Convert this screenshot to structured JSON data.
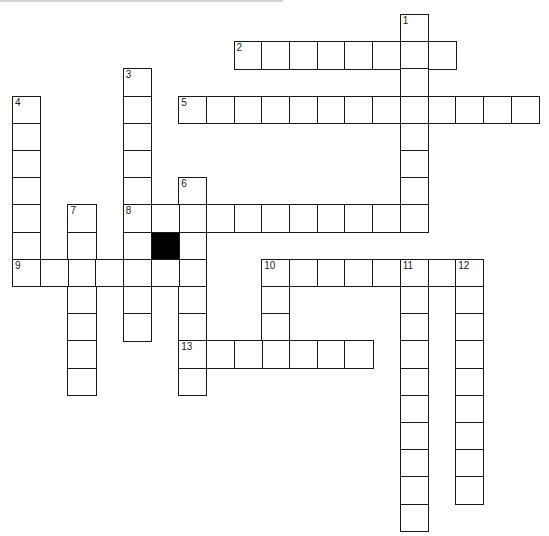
{
  "puzzle": {
    "type": "crossword",
    "grid_origin": {
      "x": 12,
      "y": 14
    },
    "cell_size": {
      "w": 27.7,
      "h": 27.2
    },
    "colors": {
      "border": "#1a1a1a",
      "fill": "#ffffff",
      "block": "#000000",
      "top_rule": "#d4d4d4"
    },
    "clue_numbers": [
      "1",
      "2",
      "3",
      "4",
      "5",
      "6",
      "7",
      "8",
      "9",
      "10",
      "11",
      "12",
      "13"
    ],
    "entries": [
      {
        "number": "1",
        "direction": "down",
        "row": 0,
        "col": 14,
        "length": 8
      },
      {
        "number": "2",
        "direction": "across",
        "row": 1,
        "col": 8,
        "length": 8
      },
      {
        "number": "3",
        "direction": "down",
        "row": 2,
        "col": 4,
        "length": 10
      },
      {
        "number": "4",
        "direction": "down",
        "row": 3,
        "col": 0,
        "length": 7
      },
      {
        "number": "5",
        "direction": "across",
        "row": 3,
        "col": 6,
        "length": 13
      },
      {
        "number": "6",
        "direction": "down",
        "row": 6,
        "col": 6,
        "length": 8
      },
      {
        "number": "7",
        "direction": "down",
        "row": 7,
        "col": 2,
        "length": 7
      },
      {
        "number": "8",
        "direction": "across",
        "row": 7,
        "col": 4,
        "length": 11
      },
      {
        "number": "9",
        "direction": "across",
        "row": 9,
        "col": 0,
        "length": 7
      },
      {
        "number": "10",
        "direction": "across",
        "row": 9,
        "col": 9,
        "length": 8
      },
      {
        "number": "10",
        "direction": "down",
        "row": 9,
        "col": 9,
        "length": 4
      },
      {
        "number": "11",
        "direction": "down",
        "row": 9,
        "col": 14,
        "length": 10
      },
      {
        "number": "12",
        "direction": "down",
        "row": 9,
        "col": 16,
        "length": 9
      },
      {
        "number": "13",
        "direction": "across",
        "row": 12,
        "col": 6,
        "length": 7
      }
    ],
    "extra_cells": [
      {
        "row": 8,
        "col": 4
      }
    ],
    "black_cells": [
      {
        "row": 8,
        "col": 5
      }
    ]
  }
}
